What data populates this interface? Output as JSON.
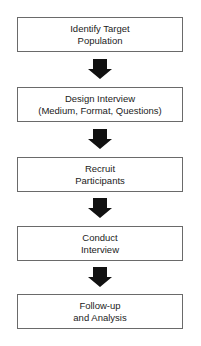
{
  "flowchart": {
    "steps": [
      {
        "line1": "Identify Target",
        "line2": "Population"
      },
      {
        "line1": "Design Interview",
        "line2": "(Medium, Format, Questions)"
      },
      {
        "line1": "Recruit",
        "line2": "Participants"
      },
      {
        "line1": "Conduct",
        "line2": "Interview"
      },
      {
        "line1": "Follow-up",
        "line2": "and Analysis"
      }
    ],
    "arrow_color": "#111111",
    "border_color": "#6a6a6a"
  }
}
